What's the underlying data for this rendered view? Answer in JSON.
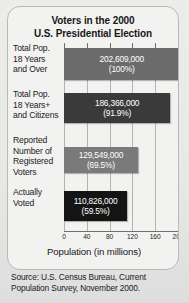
{
  "title": {
    "line1": "Voters in the 2000",
    "line2": "U.S. Presidential Election"
  },
  "source": {
    "line1": "Source: U.S. Census Bureau, Current",
    "line2": "Population Survey, November 2000."
  },
  "chart_data": {
    "type": "bar",
    "orientation": "horizontal",
    "title": "Voters in the 2000 U.S. Presidential Election",
    "xlabel": "Population (in millions)",
    "ylabel": "",
    "xlim": [
      0,
      200
    ],
    "xticks": [
      0,
      40,
      80,
      120,
      160,
      200
    ],
    "xtick_labels": [
      "0",
      "40",
      "80",
      "120",
      "160",
      "200"
    ],
    "grid": true,
    "legend": false,
    "units": "millions",
    "categories": [
      "Total Pop. 18 Years and Over",
      "Total Pop. 18 Years+ and Citizens",
      "Reported Number of Registered Voters",
      "Actually Voted"
    ],
    "values": [
      202609000,
      186366000,
      129549000,
      110826000
    ],
    "values_millions": [
      202.609,
      186.366,
      129.549,
      110.826
    ],
    "percents": [
      100,
      91.9,
      69.5,
      59.5
    ],
    "bars": [
      {
        "label_lines": [
          "Total Pop.",
          "18 Years",
          "and Over"
        ],
        "value_label": "202,609,000",
        "percent_label": "(100%)",
        "value_millions": 202.609,
        "percent": 100,
        "color": "#6b6b6b"
      },
      {
        "label_lines": [
          "Total Pop.",
          "18 Years+",
          "and Citizens"
        ],
        "value_label": "186,366,000",
        "percent_label": "(91.9%)",
        "value_millions": 186.366,
        "percent": 91.9,
        "color": "#3a3a3a"
      },
      {
        "label_lines": [
          "Reported",
          "Number of",
          "Registered",
          "Voters"
        ],
        "value_label": "129,549,000",
        "percent_label": "(69.5%)",
        "value_millions": 129.549,
        "percent": 69.5,
        "color": "#7a7a7a"
      },
      {
        "label_lines": [
          "Actually",
          "Voted"
        ],
        "value_label": "110,826,000",
        "percent_label": "(59.5%)",
        "value_millions": 110.826,
        "percent": 59.5,
        "color": "#141414"
      }
    ]
  },
  "colors": {
    "panel_bg": "#f2f2f0",
    "panel_border": "#b9b9b7",
    "page_bg": "#e9e9e7",
    "gridline": "#b3b3b1",
    "axis": "#6e6e6e",
    "text": "#17171a",
    "bar_text": "#ffffff"
  }
}
